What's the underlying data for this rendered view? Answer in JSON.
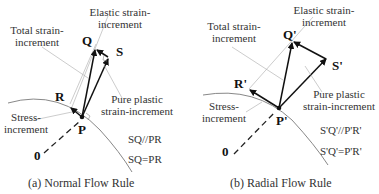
{
  "panel_a": {
    "caption": "(a) Normal Flow Rule",
    "points": {
      "P": "P",
      "Q": "Q",
      "R": "R",
      "S": "S",
      "O": "0"
    },
    "labels": {
      "elastic_1": "Elastic strain-",
      "elastic_2": "increment",
      "total_1": "Total strain-",
      "total_2": "increment",
      "stress_1": "Stress-",
      "stress_2": "increment",
      "plastic_1": "Pure plastic",
      "plastic_2": "strain-increment"
    },
    "relations": [
      "SQ//PR",
      "SQ=PR"
    ]
  },
  "panel_b": {
    "caption": "(b) Radial Flow Rule",
    "points": {
      "P": "P'",
      "Q": "Q'",
      "R": "R'",
      "S": "S'",
      "O": "0"
    },
    "labels": {
      "elastic_1": "Elastic strain-",
      "elastic_2": "increment",
      "total_1": "Total strain-",
      "total_2": "increment",
      "stress_1": "Stress-",
      "stress_2": "increment",
      "plastic_1": "Pure plastic",
      "plastic_2": "strain-increment"
    },
    "relations": [
      "S'Q'//P'R'",
      "S'Q'=P'R'"
    ]
  }
}
